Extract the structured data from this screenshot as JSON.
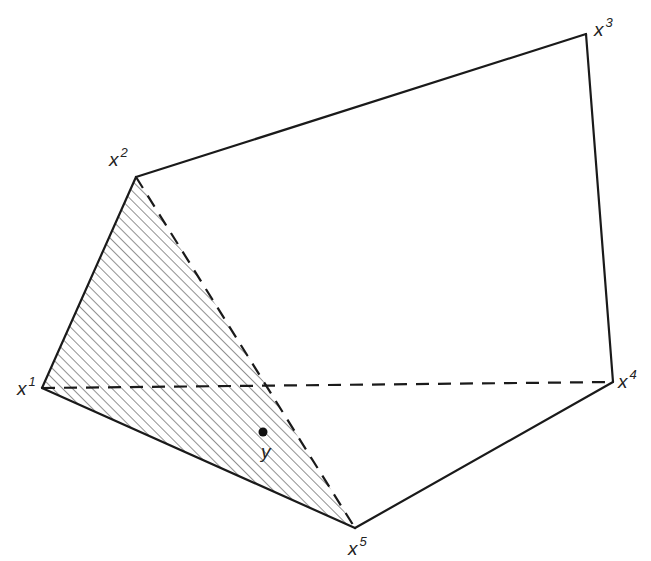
{
  "diagram": {
    "type": "polytope-with-simplex",
    "colors": {
      "stroke": "#1a1a1a",
      "hatch": "#555555",
      "background": "#ffffff"
    },
    "vertices": [
      {
        "id": "x1",
        "base": "x",
        "sup": "1"
      },
      {
        "id": "x2",
        "base": "x",
        "sup": "2"
      },
      {
        "id": "x3",
        "base": "x",
        "sup": "3"
      },
      {
        "id": "x4",
        "base": "x",
        "sup": "4"
      },
      {
        "id": "x5",
        "base": "x",
        "sup": "5"
      }
    ],
    "edges": [
      {
        "from": "x1",
        "to": "x2",
        "style": "solid"
      },
      {
        "from": "x2",
        "to": "x3",
        "style": "solid"
      },
      {
        "from": "x3",
        "to": "x4",
        "style": "solid"
      },
      {
        "from": "x4",
        "to": "x5",
        "style": "solid"
      },
      {
        "from": "x5",
        "to": "x1",
        "style": "solid"
      },
      {
        "from": "x2",
        "to": "x5",
        "style": "dashed"
      },
      {
        "from": "x1",
        "to": "x4",
        "style": "dashed"
      }
    ],
    "shaded_region": {
      "vertices": [
        "x1",
        "x2",
        "x5"
      ],
      "fill": "hatched"
    },
    "point": {
      "id": "y",
      "label": "y",
      "inside": [
        "x1",
        "x2",
        "x5"
      ]
    }
  }
}
